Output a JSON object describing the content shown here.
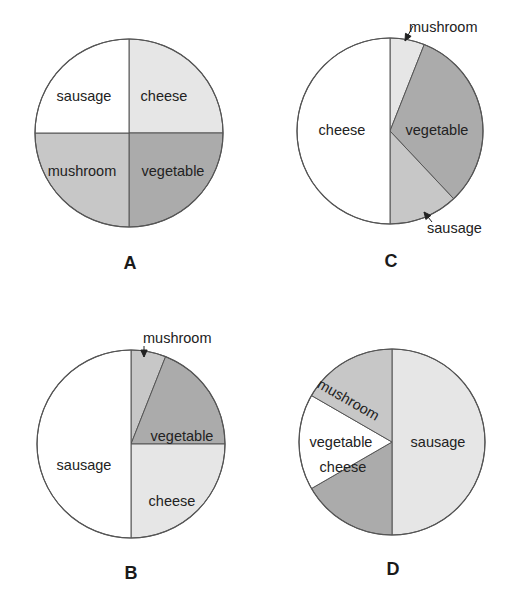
{
  "colors": {
    "white": "#ffffff",
    "light": "#e6e6e6",
    "medium": "#c7c7c7",
    "dark": "#ababab",
    "stroke": "#555555"
  },
  "chart_data": [
    {
      "type": "pie",
      "title": "A",
      "center": [
        129,
        133
      ],
      "radius": 94,
      "slices": [
        {
          "label": "cheese",
          "value": 25,
          "color": "light",
          "text_pos": [
            164,
            101
          ]
        },
        {
          "label": "vegetable",
          "value": 25,
          "color": "dark",
          "text_pos": [
            173,
            176
          ]
        },
        {
          "label": "mushroom",
          "value": 25,
          "color": "medium",
          "text_pos": [
            82,
            176
          ]
        },
        {
          "label": "sausage",
          "value": 25,
          "color": "white",
          "text_pos": [
            84,
            101
          ]
        }
      ],
      "callouts": [],
      "letter_pos": [
        130,
        269
      ]
    },
    {
      "type": "pie",
      "title": "C",
      "center": [
        390,
        131
      ],
      "radius": 93,
      "slices": [
        {
          "label": "mushroom",
          "value": 6,
          "color": "light",
          "text_pos": null
        },
        {
          "label": "vegetable",
          "value": 32,
          "color": "dark",
          "text_pos": [
            437,
            135
          ]
        },
        {
          "label": "sausage",
          "value": 12,
          "color": "medium",
          "text_pos": null
        },
        {
          "label": "cheese",
          "value": 50,
          "color": "white",
          "text_pos": [
            342,
            135
          ]
        }
      ],
      "callouts": [
        {
          "label": "mushroom",
          "text_pos": [
            409,
            32
          ],
          "arrow_from": [
            413,
            26
          ],
          "arrow_to": [
            405,
            41
          ]
        },
        {
          "label": "sausage",
          "text_pos": [
            427,
            233
          ],
          "arrow_from": [
            432,
            222
          ],
          "arrow_to": [
            424,
            212
          ]
        }
      ],
      "letter_pos": [
        391,
        267
      ]
    },
    {
      "type": "pie",
      "title": "B",
      "center": [
        131,
        444
      ],
      "radius": 94,
      "slices": [
        {
          "label": "mushroom",
          "value": 6,
          "color": "medium",
          "text_pos": null
        },
        {
          "label": "vegetable",
          "value": 19,
          "color": "dark",
          "text_pos": [
            182,
            441
          ]
        },
        {
          "label": "cheese",
          "value": 25,
          "color": "light",
          "text_pos": [
            172,
            506
          ]
        },
        {
          "label": "sausage",
          "value": 50,
          "color": "white",
          "text_pos": [
            84,
            470
          ]
        }
      ],
      "callouts": [
        {
          "label": "mushroom",
          "text_pos": [
            143,
            343
          ],
          "arrow_from": [
            144,
            346
          ],
          "arrow_to": [
            144,
            357
          ]
        }
      ],
      "letter_pos": [
        131,
        579
      ]
    },
    {
      "type": "pie",
      "title": "D",
      "center": [
        392,
        442
      ],
      "radius": 93,
      "slices": [
        {
          "label": "sausage",
          "value": 50,
          "color": "light",
          "text_pos": [
            438,
            447
          ]
        },
        {
          "label": "cheese",
          "value": 16.67,
          "color": "dark",
          "text_pos": [
            343,
            472
          ]
        },
        {
          "label": "vegetable",
          "value": 16.67,
          "color": "white",
          "text_pos": [
            341,
            447
          ]
        },
        {
          "label": "mushroom",
          "value": 16.67,
          "color": "medium",
          "text_pos": [
            346,
            404
          ],
          "rotate": 30
        }
      ],
      "callouts": [],
      "letter_pos": [
        393,
        575
      ]
    }
  ]
}
